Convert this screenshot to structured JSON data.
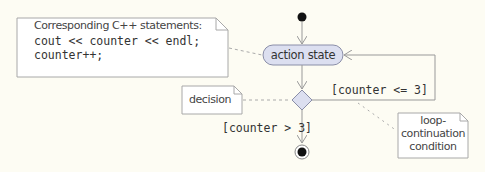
{
  "diagram": {
    "type": "UML activity diagram",
    "notes": {
      "cpp": {
        "heading": "Corresponding C++ statements:",
        "line1": "cout << counter << endl;",
        "line2": "counter++;"
      },
      "decision": {
        "text": "decision"
      },
      "loop": {
        "line1": "loop-",
        "line2": "continuation",
        "line3": "condition"
      }
    },
    "nodes": {
      "initial": {
        "kind": "initial-node"
      },
      "action": {
        "label": "action state"
      },
      "decision": {
        "kind": "decision-node"
      },
      "final": {
        "kind": "final-node"
      }
    },
    "guards": {
      "continue": "[counter <= 3]",
      "exit": "[counter > 3]"
    },
    "colors": {
      "background": "#fdfcf3",
      "action_fill": "#dcdff0",
      "line": "#9a9a9a",
      "node_fill": "#111111"
    }
  }
}
